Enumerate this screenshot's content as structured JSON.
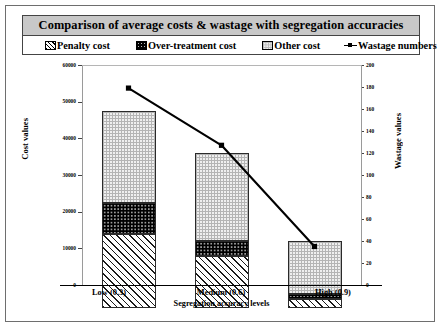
{
  "title": "Comparison of average costs & wastage with segregation accuracies",
  "legend": [
    {
      "label": "Penalty cost",
      "swatch": "hatch-swatch-icon"
    },
    {
      "label": "Over-treatment cost",
      "swatch": "dotted-black-swatch-icon"
    },
    {
      "label": "Other cost",
      "swatch": "grid-swatch-icon"
    },
    {
      "label": "Wastage numbers",
      "swatch": "line-marker-swatch-icon"
    }
  ],
  "axes": {
    "y_left_title": "Cost values",
    "y_right_title": "Wastage values",
    "x_title": "Segregation accuracy levels",
    "y_left_ticks": [
      "0",
      "10000",
      "20000",
      "30000",
      "40000",
      "50000",
      "60000"
    ],
    "y_right_ticks": [
      "0",
      "20",
      "40",
      "60",
      "80",
      "100",
      "120",
      "140",
      "160",
      "180",
      "200"
    ],
    "x_ticks": [
      "Low (0.3)",
      "Medium (0.6)",
      "High (0.9)"
    ]
  },
  "chart_data": {
    "type": "bar",
    "title": "Comparison of average costs & wastage with segregation accuracies",
    "xlabel": "Segregation accuracy levels",
    "ylabel": "Cost values",
    "y2label": "Wastage values",
    "categories": [
      "Low (0.3)",
      "Medium (0.6)",
      "High (0.9)"
    ],
    "ylim": [
      0,
      60000
    ],
    "y2lim": [
      0,
      200
    ],
    "grid": false,
    "legend_position": "top",
    "stacked": true,
    "series": [
      {
        "name": "Penalty cost",
        "axis": "left",
        "type": "bar",
        "values": [
          20200,
          14200,
          2500
        ]
      },
      {
        "name": "Over-treatment cost",
        "axis": "left",
        "type": "bar",
        "values": [
          8500,
          4100,
          1400
        ]
      },
      {
        "name": "Other cost",
        "axis": "left",
        "type": "bar",
        "values": [
          25000,
          24000,
          14400
        ]
      },
      {
        "name": "Wastage numbers",
        "axis": "right",
        "type": "line",
        "values": [
          179,
          127,
          35
        ]
      }
    ],
    "stack_totals": [
      53700,
      42300,
      18300
    ]
  }
}
